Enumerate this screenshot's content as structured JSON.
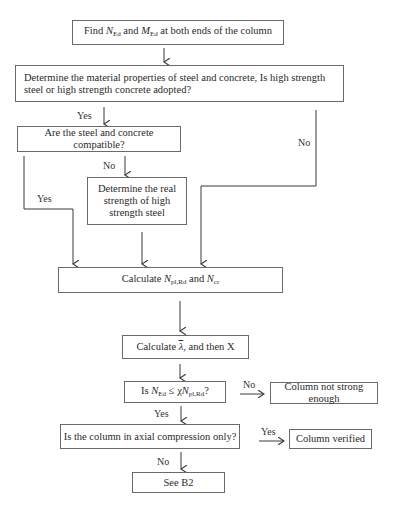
{
  "flowchart": {
    "nodes": {
      "find_forces": {
        "parts": [
          "Find ",
          "N",
          "Ed",
          " and ",
          "M",
          "Ed",
          " at both ends of the column"
        ]
      },
      "material": {
        "text": "Determine the material properties of steel and concrete, Is high strength steel or high strength concrete adopted?"
      },
      "compatible": {
        "text": "Are the steel and concrete compatible?"
      },
      "real_strength": {
        "text": "Determine the real strength of high strength steel"
      },
      "calc_npl": {
        "parts": [
          "Calculate ",
          "N",
          "pl,Rd",
          " and ",
          "N",
          "cr"
        ]
      },
      "calc_lambda": {
        "parts": [
          "Calculate ",
          "λ",
          ", and then X"
        ]
      },
      "check_strength": {
        "parts": [
          "Is ",
          "N",
          "Ed",
          " ≤ χ",
          "N",
          "pl,Rd",
          "?"
        ]
      },
      "not_strong": {
        "text": "Column not strong enough"
      },
      "axial_only": {
        "text": "Is the column in axial compression only?"
      },
      "verified": {
        "text": "Column verified"
      },
      "see_b2": {
        "text": "See B2"
      }
    },
    "edge_labels": {
      "material_yes": "Yes",
      "material_no": "No",
      "compatible_no": "No",
      "compatible_yes": "Yes",
      "check_no": "No",
      "check_yes": "Yes",
      "axial_yes": "Yes",
      "axial_no": "No"
    },
    "colors": {
      "line": "#3a3a3a",
      "border": "#6a6a6a"
    }
  }
}
